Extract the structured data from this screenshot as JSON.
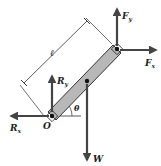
{
  "diagram": {
    "type": "free-body-diagram",
    "colors": {
      "rod_fill": "#b8b8b8",
      "rod_stroke": "#333333",
      "arrow": "#444444",
      "line": "#333333",
      "background": "#ffffff"
    },
    "labels": {
      "Fy": {
        "main": "F",
        "sub": "y"
      },
      "Fx": {
        "main": "F",
        "sub": "x"
      },
      "Ry": {
        "main": "R",
        "sub": "y"
      },
      "Rx": {
        "main": "R",
        "sub": "x"
      },
      "W": "W",
      "O": "O",
      "theta": "θ",
      "length": "ℓ"
    },
    "forces": [
      {
        "name": "F_y",
        "direction": "up",
        "at": "top end"
      },
      {
        "name": "F_x",
        "direction": "right",
        "at": "top end"
      },
      {
        "name": "R_y",
        "direction": "up",
        "at": "pivot O"
      },
      {
        "name": "R_x",
        "direction": "left",
        "at": "pivot O"
      },
      {
        "name": "W",
        "direction": "down",
        "at": "center of mass"
      }
    ]
  }
}
